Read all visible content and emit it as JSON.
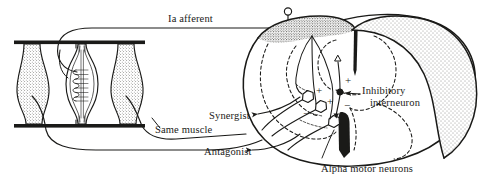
{
  "figure": {
    "type": "neuroanatomy-line-diagram",
    "background_color": "#ffffff",
    "ink_color": "#1a1a18"
  },
  "labels": {
    "ia_afferent": "Ia afferent",
    "synergist": "Synergist",
    "same_muscle": "Same muscle",
    "antagonist": "Antagonist",
    "inhibitory_line1": "Inhibitory",
    "inhibitory_line2": "interneuron",
    "alpha_motor_neurons": "Alpha motor neurons"
  },
  "synapse_signs": {
    "excitatory_same_muscle": "+",
    "excitatory_synergist": "+",
    "excitatory_interneuron": "+",
    "inhibitory_antagonist": "−",
    "inhibitory_branch": "−"
  },
  "structures": {
    "muscle_fibers": [
      {
        "name": "extrafusal-fiber-left"
      },
      {
        "name": "muscle-spindle-intrafusal"
      },
      {
        "name": "extrafusal-fiber-right"
      }
    ],
    "tendon_bars": [
      {
        "name": "tendon-bar-top"
      },
      {
        "name": "tendon-bar-bottom"
      }
    ],
    "dorsal_root_ganglion": {
      "name": "dorsal-root-ganglion-cell"
    },
    "spinal_cord": {
      "name": "spinal-cord-cross-section",
      "gray_matter": "butterfly-shaped dashed outline",
      "white_matter": "stippled shading",
      "ventral_fissure": "dark wedge"
    },
    "motor_neurons": [
      {
        "name": "alpha-motor-neuron-synergist"
      },
      {
        "name": "alpha-motor-neuron-same-muscle"
      },
      {
        "name": "alpha-motor-neuron-antagonist"
      }
    ],
    "interneuron": {
      "name": "inhibitory-interneuron-soma"
    }
  }
}
